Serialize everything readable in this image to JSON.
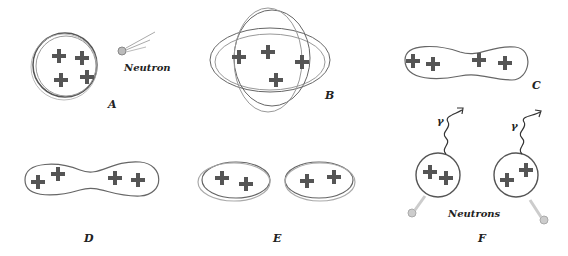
{
  "figure": {
    "panels": [
      {
        "id": "A",
        "label": "A",
        "annotation": "Neutron",
        "protons": 4,
        "shape": "sphere"
      },
      {
        "id": "B",
        "label": "B",
        "protons": 4,
        "shape": "oscillating-ellipsoid"
      },
      {
        "id": "C",
        "label": "C",
        "protons": 4,
        "shape": "elongated"
      },
      {
        "id": "D",
        "label": "D",
        "protons": 4,
        "shape": "dumbbell"
      },
      {
        "id": "E",
        "label": "E",
        "protons": 4,
        "shape": "two-fragments"
      },
      {
        "id": "F",
        "label": "F",
        "annotation": "Neutrons",
        "gamma_labels": [
          "γ",
          "γ"
        ],
        "protons": 4,
        "shape": "two-spheres-emitting"
      }
    ],
    "colors": {
      "ink": "#333333",
      "faint": "#9a9a9a",
      "background": "#ffffff"
    }
  }
}
